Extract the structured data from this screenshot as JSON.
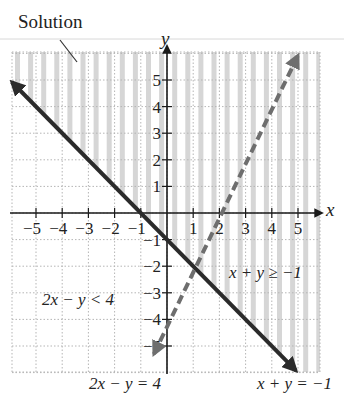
{
  "chart_data": {
    "type": "line",
    "title": "",
    "xlabel": "x",
    "ylabel": "y",
    "xlim": [
      -6,
      6
    ],
    "ylim": [
      -6,
      6
    ],
    "grid": true,
    "x_ticks": [
      "-5",
      "-4",
      "-3",
      "-2",
      "-1",
      "1",
      "2",
      "3",
      "4",
      "5"
    ],
    "y_ticks": [
      "5",
      "4",
      "3",
      "2",
      "1",
      "-1",
      "-2",
      "-3",
      "-4",
      "-5"
    ],
    "series": [
      {
        "name": "x + y = -1",
        "style": "solid",
        "color": "#2b2b2b",
        "points": [
          [
            -6,
            5
          ],
          [
            5,
            -6
          ]
        ]
      },
      {
        "name": "2x - y = 4",
        "style": "dashed",
        "color": "#6a6a6a",
        "points": [
          [
            -0.5,
            -5
          ],
          [
            5,
            6
          ]
        ]
      }
    ],
    "shaded_region": {
      "label": "Solution",
      "description": "vertical-line shading where x + y >= -1 and 2x - y < 4"
    },
    "annotations": [
      {
        "text": "Solution",
        "position": "top-left"
      },
      {
        "text": "x + y ≥ −1",
        "position": "right-middle"
      },
      {
        "text": "2x − y < 4",
        "position": "left-lower"
      },
      {
        "text": "2x − y = 4",
        "position": "bottom-center"
      },
      {
        "text": "x + y = −1",
        "position": "bottom-right"
      }
    ]
  },
  "labels": {
    "solution": "Solution",
    "axis_x": "x",
    "axis_y": "y",
    "ineq1": "x + y ≥ −1",
    "ineq2": "2x − y < 4",
    "eq2": "2x − y = 4",
    "eq1": "x + y = −1"
  },
  "colors": {
    "shade": "#d6d6d6",
    "grid": "#b5b5b5",
    "axis": "#1a1a1a",
    "solid_line": "#2b2b2b",
    "dashed_line": "#6e6e6e"
  }
}
